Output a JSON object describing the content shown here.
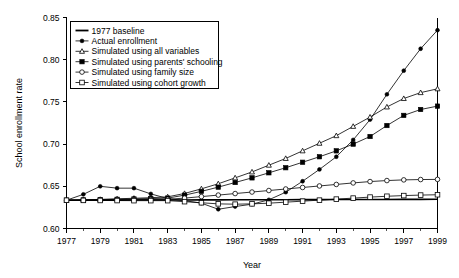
{
  "chart_data": {
    "type": "line",
    "title": "",
    "xlabel": "Year",
    "ylabel": "School enrollment rate",
    "xlim": [
      1977,
      1999
    ],
    "ylim": [
      0.6,
      0.85
    ],
    "ytick_labels": [
      "0.60",
      "0.65",
      "0.70",
      "0.75",
      "0.80",
      "0.85"
    ],
    "ytick_values": [
      0.6,
      0.65,
      0.7,
      0.75,
      0.8,
      0.85
    ],
    "xtick_labels": [
      "1977",
      "1979",
      "1981",
      "1983",
      "1985",
      "1987",
      "1989",
      "1991",
      "1993",
      "1995",
      "1997",
      "1999"
    ],
    "xtick_values": [
      1977,
      1979,
      1981,
      1983,
      1985,
      1987,
      1989,
      1991,
      1993,
      1995,
      1997,
      1999
    ],
    "minor_xtick_values": [
      1978,
      1980,
      1982,
      1984,
      1986,
      1988,
      1990,
      1992,
      1994,
      1996,
      1998
    ],
    "grid": false,
    "legend_position": "top-left",
    "x": [
      1977,
      1978,
      1979,
      1980,
      1981,
      1982,
      1983,
      1984,
      1985,
      1986,
      1987,
      1988,
      1989,
      1990,
      1991,
      1992,
      1993,
      1994,
      1995,
      1996,
      1997,
      1998,
      1999
    ],
    "series": [
      {
        "name": "1977 baseline",
        "marker": "none",
        "fill": "none",
        "values": [
          0.6335,
          0.6335,
          0.6336,
          0.6336,
          0.6337,
          0.6337,
          0.6338,
          0.6338,
          0.6339,
          0.6339,
          0.634,
          0.634,
          0.6341,
          0.6341,
          0.6342,
          0.6342,
          0.6343,
          0.6343,
          0.6344,
          0.6344,
          0.6345,
          0.6345,
          0.6346
        ]
      },
      {
        "name": "Actual enrollment",
        "marker": "solid-circle",
        "fill": "#000000",
        "values": [
          0.6335,
          0.6405,
          0.65,
          0.6478,
          0.6478,
          0.641,
          0.6355,
          0.633,
          0.63,
          0.6228,
          0.626,
          0.6288,
          0.634,
          0.643,
          0.656,
          0.67,
          0.685,
          0.705,
          0.729,
          0.759,
          0.787,
          0.813,
          0.835
        ]
      },
      {
        "name": "Simulated using all variables",
        "marker": "open-triangle",
        "fill": "#ffffff",
        "values": [
          0.6335,
          0.634,
          0.6345,
          0.6352,
          0.6358,
          0.6365,
          0.6375,
          0.6415,
          0.647,
          0.653,
          0.66,
          0.667,
          0.675,
          0.683,
          0.692,
          0.701,
          0.71,
          0.721,
          0.732,
          0.744,
          0.754,
          0.761,
          0.7655
        ]
      },
      {
        "name": "Simulated using parents' schooling",
        "marker": "solid-square",
        "fill": "#000000",
        "values": [
          0.6335,
          0.6338,
          0.6342,
          0.6346,
          0.635,
          0.6355,
          0.636,
          0.6395,
          0.644,
          0.649,
          0.6545,
          0.66,
          0.666,
          0.672,
          0.6785,
          0.685,
          0.692,
          0.7,
          0.709,
          0.722,
          0.734,
          0.741,
          0.745
        ]
      },
      {
        "name": "Simulated using family size",
        "marker": "open-circle",
        "fill": "#ffffff",
        "values": [
          0.6335,
          0.6336,
          0.6338,
          0.634,
          0.6342,
          0.6344,
          0.6346,
          0.636,
          0.6378,
          0.6396,
          0.6414,
          0.6432,
          0.645,
          0.6468,
          0.6486,
          0.6504,
          0.6522,
          0.654,
          0.6556,
          0.6568,
          0.6576,
          0.658,
          0.6582
        ]
      },
      {
        "name": "Simulated using cohort growth",
        "marker": "open-square",
        "fill": "#ffffff",
        "values": [
          0.6335,
          0.6333,
          0.6332,
          0.6331,
          0.633,
          0.633,
          0.633,
          0.6318,
          0.6305,
          0.6292,
          0.6288,
          0.6292,
          0.63,
          0.6312,
          0.6324,
          0.6336,
          0.6348,
          0.636,
          0.6372,
          0.6382,
          0.639,
          0.6396,
          0.64
        ]
      }
    ]
  }
}
